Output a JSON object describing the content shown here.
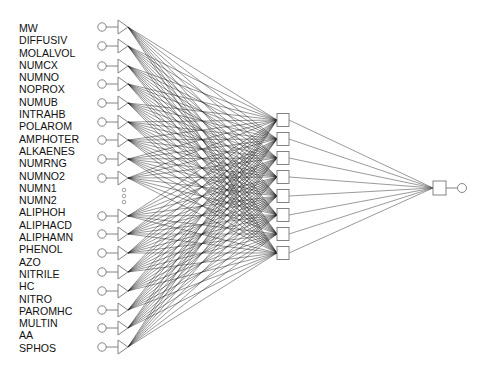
{
  "diagram": {
    "type": "neural-network",
    "input_labels": [
      "MW",
      "DIFFUSIV",
      "MOLALVOL",
      "NUMCX",
      "NUMNO",
      "NOPROX",
      "NUMUB",
      "INTRAHB",
      "POLAROM",
      "AMPHOTER",
      "ALKAENES",
      "NUMRNG",
      "NUMNO2",
      "NUMN1",
      "NUMN2",
      "ALIPHOH",
      "ALIPHACD",
      "ALIPHAMN",
      "PHENOL",
      "AZO",
      "NITRILE",
      "HC",
      "NITRO",
      "PAROMHC",
      "MULTIN",
      "AA",
      "SPHOS"
    ],
    "input_nodes_y": [
      27,
      46,
      66,
      84,
      103,
      122,
      140,
      159,
      178,
      216,
      234,
      253,
      272,
      291,
      310,
      328,
      347
    ],
    "ellipsis_dots_y": [
      190,
      196,
      202
    ],
    "hidden_nodes_y": [
      120,
      139,
      158,
      177,
      196,
      215,
      234,
      253
    ],
    "output_node": {
      "x": 439,
      "y": 188
    },
    "colors": {
      "connection": "#1a1a1a",
      "node_stroke": "#777777",
      "background": "#ffffff"
    }
  }
}
